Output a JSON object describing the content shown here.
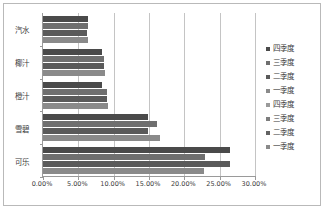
{
  "chart_data": {
    "type": "bar",
    "orientation": "horizontal",
    "title": "",
    "xlabel": "",
    "ylabel": "",
    "grid": true,
    "legend_position": "right",
    "xlim": [
      0,
      0.3
    ],
    "xticks": [
      "0.00%",
      "5.00%",
      "10.00%",
      "15.00%",
      "20.00%",
      "25.00%",
      "30.00%"
    ],
    "xtick_values": [
      0,
      5,
      10,
      15,
      20,
      25,
      30
    ],
    "categories": [
      "汽水",
      "椰汁",
      "橙汁",
      "雪碧",
      "可乐"
    ],
    "series": [
      {
        "name": "四季度",
        "color": "#4a4a4a",
        "values": [
          6.4,
          8.3,
          8.3,
          14.8,
          26.5
        ]
      },
      {
        "name": "三季度",
        "color": "#6f6f6f",
        "values": [
          6.3,
          8.6,
          9.0,
          16.2,
          22.9
        ]
      },
      {
        "name": "二季度",
        "color": "#5a5a5a",
        "values": [
          6.2,
          8.7,
          9.0,
          14.9,
          26.5
        ]
      },
      {
        "name": "一季度",
        "color": "#8a8a8a",
        "values": [
          6.4,
          8.8,
          9.2,
          16.5,
          22.8
        ]
      }
    ],
    "legend_entries": [
      {
        "label": "四季度",
        "color": "#4a4a4a"
      },
      {
        "label": "三季度",
        "color": "#6f6f6f"
      },
      {
        "label": "二季度",
        "color": "#5a5a5a"
      },
      {
        "label": "一季度",
        "color": "#8a8a8a"
      },
      {
        "label": "四季度",
        "color": "#9a9a9a"
      },
      {
        "label": "三季度",
        "color": "#7d7d7d"
      },
      {
        "label": "二季度",
        "color": "#636363"
      },
      {
        "label": "一季度",
        "color": "#8a8a8a"
      }
    ]
  }
}
